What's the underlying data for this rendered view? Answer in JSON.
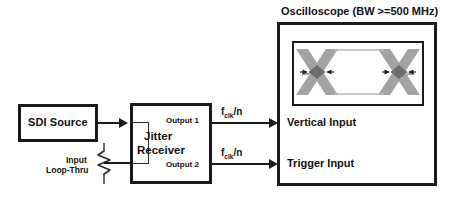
{
  "diagram": {
    "blocks": {
      "source": {
        "label": "SDI Source"
      },
      "receiver": {
        "label_line1": "Jitter",
        "label_line2": "Receiver",
        "output1": "Output 1",
        "output2": "Output 2",
        "loop_thru_line1": "Input",
        "loop_thru_line2": "Loop-Thru",
        "termination_icon": "resistor-icon"
      },
      "scope": {
        "title": "Oscilloscope (BW >=500 MHz)",
        "vertical_input": "Vertical Input",
        "trigger_input": "Trigger Input"
      }
    },
    "signals": {
      "vertical_path": "f_clk/n",
      "trigger_path": "f_clk/n",
      "symbol_base": "f",
      "symbol_sub": "clk",
      "symbol_divisor": "/n"
    },
    "eye_diagram": {
      "annotation_left": "jitter",
      "annotation_right": "jitter",
      "trace_color": "#a3a3a3",
      "crossing_color": "#6d6d6d"
    },
    "colors": {
      "line": "#1a1a1a",
      "text": "#111111",
      "background": "#ffffff"
    }
  }
}
